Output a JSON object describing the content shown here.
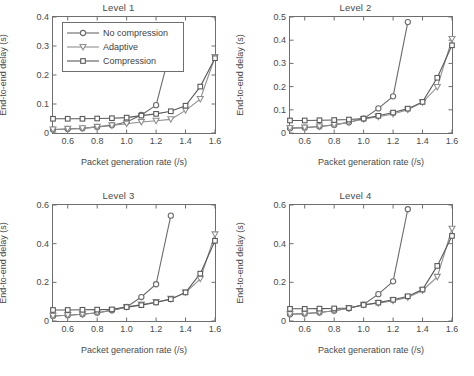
{
  "figure": {
    "axis_label_x": "Packet generation rate (/s)",
    "axis_label_y": "End-to-end delay (s)",
    "legend": {
      "items": [
        {
          "label": "No compression",
          "marker": "circle",
          "color": "#6b6b6b"
        },
        {
          "label": "Adaptive",
          "marker": "triangle-down",
          "color": "#8f8f8f"
        },
        {
          "label": "Compression",
          "marker": "square",
          "color": "#5a5a5a"
        }
      ]
    }
  },
  "chart_data": [
    {
      "type": "line",
      "title": "Level 1",
      "xlabel": "Packet generation rate (/s)",
      "ylabel": "End-to-end delay (s)",
      "xlim": [
        0.5,
        1.6
      ],
      "ylim": [
        0,
        0.4
      ],
      "xticks": [
        0.6,
        0.8,
        1.0,
        1.2,
        1.4,
        1.6
      ],
      "xticklabels": [
        "0.6",
        "0.8",
        "1.0",
        "1.2",
        "1.4",
        "1.6"
      ],
      "yticks": [
        0,
        0.1,
        0.2,
        0.3,
        0.4
      ],
      "yticklabels": [
        "0",
        "0.1",
        "0.2",
        "0.3",
        "0.4"
      ],
      "grid": false,
      "legend_position": "upper-left",
      "x": [
        0.5,
        0.6,
        0.7,
        0.8,
        0.9,
        1.0,
        1.1,
        1.2,
        1.3,
        1.4,
        1.5,
        1.6
      ],
      "series": [
        {
          "name": "No compression",
          "marker": "circle",
          "color": "#6b6b6b",
          "x": [
            0.5,
            0.6,
            0.7,
            0.8,
            0.9,
            1.0,
            1.1,
            1.2,
            1.3
          ],
          "values": [
            0.012,
            0.014,
            0.016,
            0.021,
            0.027,
            0.038,
            0.062,
            0.096,
            0.291
          ]
        },
        {
          "name": "Adaptive",
          "marker": "triangle-down",
          "color": "#8f8f8f",
          "x": [
            0.5,
            0.6,
            0.7,
            0.8,
            0.9,
            1.0,
            1.1,
            1.2,
            1.3,
            1.4,
            1.5,
            1.6
          ],
          "values": [
            0.012,
            0.014,
            0.016,
            0.021,
            0.026,
            0.032,
            0.038,
            0.042,
            0.047,
            0.078,
            0.117,
            0.262
          ]
        },
        {
          "name": "Compression",
          "marker": "square",
          "color": "#5a5a5a",
          "x": [
            0.5,
            0.6,
            0.7,
            0.8,
            0.9,
            1.0,
            1.1,
            1.2,
            1.3,
            1.4,
            1.5,
            1.6
          ],
          "values": [
            0.049,
            0.049,
            0.049,
            0.05,
            0.051,
            0.053,
            0.06,
            0.066,
            0.075,
            0.094,
            0.16,
            0.258
          ]
        }
      ]
    },
    {
      "type": "line",
      "title": "Level 2",
      "xlabel": "Packet generation rate (/s)",
      "ylabel": "End-to-end delay (s)",
      "xlim": [
        0.5,
        1.6
      ],
      "ylim": [
        0,
        0.5
      ],
      "xticks": [
        0.6,
        0.8,
        1.0,
        1.2,
        1.4,
        1.6
      ],
      "xticklabels": [
        "0.6",
        "0.8",
        "1.0",
        "1.2",
        "1.4",
        "1.6"
      ],
      "yticks": [
        0,
        0.1,
        0.2,
        0.3,
        0.4,
        0.5
      ],
      "yticklabels": [
        "0",
        "0.1",
        "0.2",
        "0.3",
        "0.4",
        "0.5"
      ],
      "grid": false,
      "legend_position": "none",
      "x": [
        0.5,
        0.6,
        0.7,
        0.8,
        0.9,
        1.0,
        1.1,
        1.2,
        1.3,
        1.4,
        1.5,
        1.6
      ],
      "series": [
        {
          "name": "No compression",
          "marker": "circle",
          "color": "#6b6b6b",
          "x": [
            0.5,
            0.6,
            0.7,
            0.8,
            0.9,
            1.0,
            1.1,
            1.2,
            1.3
          ],
          "values": [
            0.021,
            0.023,
            0.028,
            0.035,
            0.046,
            0.062,
            0.106,
            0.158,
            0.478
          ]
        },
        {
          "name": "Adaptive",
          "marker": "triangle-down",
          "color": "#8f8f8f",
          "x": [
            0.5,
            0.6,
            0.7,
            0.8,
            0.9,
            1.0,
            1.1,
            1.2,
            1.3,
            1.4,
            1.5,
            1.6
          ],
          "values": [
            0.021,
            0.023,
            0.028,
            0.035,
            0.046,
            0.06,
            0.07,
            0.082,
            0.1,
            0.132,
            0.198,
            0.405
          ]
        },
        {
          "name": "Compression",
          "marker": "square",
          "color": "#5a5a5a",
          "x": [
            0.5,
            0.6,
            0.7,
            0.8,
            0.9,
            1.0,
            1.1,
            1.2,
            1.3,
            1.4,
            1.5,
            1.6
          ],
          "values": [
            0.054,
            0.054,
            0.055,
            0.056,
            0.058,
            0.062,
            0.074,
            0.088,
            0.105,
            0.134,
            0.238,
            0.378
          ]
        }
      ]
    },
    {
      "type": "line",
      "title": "Level 3",
      "xlabel": "Packet generation rate (/s)",
      "ylabel": "End-to-end delay (s)",
      "xlim": [
        0.5,
        1.6
      ],
      "ylim": [
        0,
        0.6
      ],
      "xticks": [
        0.6,
        0.8,
        1.0,
        1.2,
        1.4,
        1.6
      ],
      "xticklabels": [
        "0.6",
        "0.8",
        "1.0",
        "1.2",
        "1.4",
        "1.6"
      ],
      "yticks": [
        0,
        0.2,
        0.4,
        0.6
      ],
      "yticklabels": [
        "0",
        "0.2",
        "0.4",
        "0.6"
      ],
      "grid": false,
      "legend_position": "none",
      "x": [
        0.5,
        0.6,
        0.7,
        0.8,
        0.9,
        1.0,
        1.1,
        1.2,
        1.3,
        1.4,
        1.5,
        1.6
      ],
      "series": [
        {
          "name": "No compression",
          "marker": "circle",
          "color": "#6b6b6b",
          "x": [
            0.5,
            0.6,
            0.7,
            0.8,
            0.9,
            1.0,
            1.1,
            1.2,
            1.3
          ],
          "values": [
            0.026,
            0.03,
            0.035,
            0.043,
            0.055,
            0.073,
            0.124,
            0.19,
            0.545
          ]
        },
        {
          "name": "Adaptive",
          "marker": "triangle-down",
          "color": "#8f8f8f",
          "x": [
            0.5,
            0.6,
            0.7,
            0.8,
            0.9,
            1.0,
            1.1,
            1.2,
            1.3,
            1.4,
            1.5,
            1.6
          ],
          "values": [
            0.026,
            0.03,
            0.035,
            0.043,
            0.055,
            0.072,
            0.085,
            0.098,
            0.114,
            0.147,
            0.218,
            0.448
          ]
        },
        {
          "name": "Compression",
          "marker": "square",
          "color": "#5a5a5a",
          "x": [
            0.5,
            0.6,
            0.7,
            0.8,
            0.9,
            1.0,
            1.1,
            1.2,
            1.3,
            1.4,
            1.5,
            1.6
          ],
          "values": [
            0.057,
            0.057,
            0.058,
            0.059,
            0.06,
            0.072,
            0.082,
            0.096,
            0.113,
            0.148,
            0.245,
            0.415
          ]
        }
      ]
    },
    {
      "type": "line",
      "title": "Level 4",
      "xlabel": "Packet generation rate (/s)",
      "ylabel": "End-to-end delay (s)",
      "xlim": [
        0.5,
        1.6
      ],
      "ylim": [
        0,
        0.6
      ],
      "xticks": [
        0.6,
        0.8,
        1.0,
        1.2,
        1.4,
        1.6
      ],
      "xticklabels": [
        "0.6",
        "0.8",
        "1.0",
        "1.2",
        "1.4",
        "1.6"
      ],
      "yticks": [
        0,
        0.2,
        0.4,
        0.6
      ],
      "yticklabels": [
        "0",
        "0.2",
        "0.4",
        "0.6"
      ],
      "grid": false,
      "legend_position": "none",
      "x": [
        0.5,
        0.6,
        0.7,
        0.8,
        0.9,
        1.0,
        1.1,
        1.2,
        1.3,
        1.4,
        1.5,
        1.6
      ],
      "series": [
        {
          "name": "No compression",
          "marker": "circle",
          "color": "#6b6b6b",
          "x": [
            0.5,
            0.6,
            0.7,
            0.8,
            0.9,
            1.0,
            1.1,
            1.2,
            1.3
          ],
          "values": [
            0.035,
            0.038,
            0.044,
            0.053,
            0.066,
            0.085,
            0.139,
            0.205,
            0.578
          ]
        },
        {
          "name": "Adaptive",
          "marker": "triangle-down",
          "color": "#8f8f8f",
          "x": [
            0.5,
            0.6,
            0.7,
            0.8,
            0.9,
            1.0,
            1.1,
            1.2,
            1.3,
            1.4,
            1.5,
            1.6
          ],
          "values": [
            0.035,
            0.038,
            0.044,
            0.053,
            0.066,
            0.084,
            0.092,
            0.105,
            0.122,
            0.158,
            0.228,
            0.477
          ]
        },
        {
          "name": "Compression",
          "marker": "square",
          "color": "#5a5a5a",
          "x": [
            0.5,
            0.6,
            0.7,
            0.8,
            0.9,
            1.0,
            1.1,
            1.2,
            1.3,
            1.4,
            1.5,
            1.6
          ],
          "values": [
            0.063,
            0.063,
            0.064,
            0.065,
            0.067,
            0.083,
            0.095,
            0.11,
            0.128,
            0.163,
            0.285,
            0.44
          ]
        }
      ]
    }
  ]
}
